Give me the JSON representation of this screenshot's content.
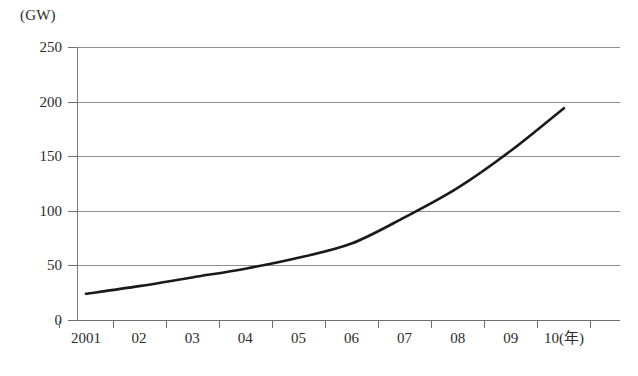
{
  "figure": {
    "unit_label": "(GW)",
    "caption": ""
  },
  "chart_data": {
    "type": "line",
    "title": "",
    "xlabel": "(年)",
    "ylabel": "(GW)",
    "categories": [
      "2001",
      "02",
      "03",
      "04",
      "05",
      "06",
      "07",
      "08",
      "09",
      "10"
    ],
    "x": [
      2001,
      2002,
      2003,
      2004,
      2005,
      2006,
      2007,
      2008,
      2009,
      2010
    ],
    "values": [
      24,
      31,
      39,
      47,
      57,
      70,
      94,
      121,
      155,
      194
    ],
    "series": [
      {
        "name": "",
        "values": [
          24,
          31,
          39,
          47,
          57,
          70,
          94,
          121,
          155,
          194
        ],
        "color": "#1a1a1a"
      }
    ],
    "xlim": [
      2001,
      2010
    ],
    "ylim": [
      0,
      250
    ],
    "yticks": [
      0,
      50,
      100,
      150,
      200,
      250
    ],
    "ytick_labels": [
      "0",
      "50",
      "100",
      "150",
      "200",
      "250"
    ],
    "xtick_labels": [
      "2001",
      "02",
      "03",
      "04",
      "05",
      "06",
      "07",
      "08",
      "09",
      "10(年)"
    ],
    "grid": "horizontal",
    "legend": "none",
    "line_width": 2.6,
    "smooth": true
  },
  "axes": {
    "y_ticks": [
      {
        "label": "250",
        "value": 250
      },
      {
        "label": "200",
        "value": 200
      },
      {
        "label": "150",
        "value": 150
      },
      {
        "label": "100",
        "value": 100
      },
      {
        "label": "50",
        "value": 50
      },
      {
        "label": "0",
        "value": 0
      }
    ],
    "x_ticks": [
      {
        "label": "2001",
        "value": 2001
      },
      {
        "label": "02",
        "value": 2002
      },
      {
        "label": "03",
        "value": 2003
      },
      {
        "label": "04",
        "value": 2004
      },
      {
        "label": "05",
        "value": 2005
      },
      {
        "label": "06",
        "value": 2006
      },
      {
        "label": "07",
        "value": 2007
      },
      {
        "label": "08",
        "value": 2008
      },
      {
        "label": "09",
        "value": 2009
      },
      {
        "label": "10(年)",
        "value": 2010
      }
    ]
  },
  "colors": {
    "series_line": "#1a1a1a",
    "gridline": "#8e8e8e",
    "axis": "#6f6f6f",
    "text": "#2b2b2b",
    "background": "#ffffff"
  }
}
